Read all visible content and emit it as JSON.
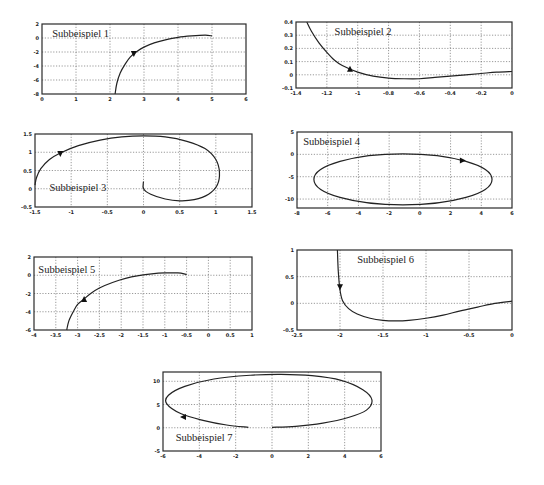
{
  "chart_data": [
    {
      "type": "line",
      "title": "Subbeispiel 1",
      "xlim": [
        0,
        6
      ],
      "ylim": [
        -8,
        2
      ],
      "xticks": [
        "0",
        "1",
        "2",
        "3",
        "4",
        "5",
        "6"
      ],
      "yticks": [
        "2",
        "0",
        "-2",
        "-4",
        "-6",
        "-8"
      ],
      "grid": true,
      "x": [
        2.15,
        2.2,
        2.3,
        2.45,
        2.6,
        2.8,
        3.0,
        3.3,
        3.6,
        4.0,
        4.4,
        4.8,
        5.0
      ],
      "y": [
        -8,
        -6.5,
        -5.0,
        -3.7,
        -2.7,
        -1.9,
        -1.3,
        -0.7,
        -0.3,
        0.1,
        0.3,
        0.4,
        0.3
      ],
      "arrow": {
        "x": 2.7,
        "y": -2.3,
        "direction": "down"
      },
      "label_pos": {
        "x": 0.3,
        "y": 0.2
      }
    },
    {
      "type": "line",
      "title": "Subbeispiel 2",
      "xlim": [
        -1.4,
        0
      ],
      "ylim": [
        -0.1,
        0.4
      ],
      "xticks": [
        "-1.4",
        "-1.2",
        "-1",
        "-0.8",
        "-0.6",
        "-0.4",
        "-0.2",
        "0"
      ],
      "yticks": [
        "0.4",
        "0.3",
        "0.2",
        "0.1",
        "0",
        "-0.1"
      ],
      "grid": true,
      "x": [
        -1.33,
        -1.3,
        -1.25,
        -1.2,
        -1.15,
        -1.1,
        -1.0,
        -0.9,
        -0.8,
        -0.7,
        -0.6,
        -0.5,
        -0.4,
        -0.3,
        -0.2,
        -0.1,
        0
      ],
      "y": [
        0.4,
        0.33,
        0.24,
        0.17,
        0.11,
        0.07,
        0.02,
        -0.01,
        -0.025,
        -0.03,
        -0.03,
        -0.02,
        -0.01,
        0.0,
        0.01,
        0.02,
        0.025
      ],
      "arrow": {
        "x": -1.05,
        "y": 0.045,
        "direction": "up"
      },
      "label_pos": {
        "x": -1.15,
        "y": 0.3
      }
    },
    {
      "type": "line",
      "title": "Subbeispiel 3",
      "xlim": [
        -1.5,
        1.5
      ],
      "ylim": [
        -0.5,
        1.5
      ],
      "xticks": [
        "-1.5",
        "-1",
        "-0.5",
        "0",
        "0.5",
        "1",
        "1.5"
      ],
      "yticks": [
        "1.5",
        "1",
        "0.5",
        "0",
        "-0.5"
      ],
      "grid": true,
      "x": [
        0,
        0,
        0.1,
        0.3,
        0.5,
        0.7,
        0.9,
        1.02,
        1.05,
        1.0,
        0.85,
        0.6,
        0.3,
        0.0,
        -0.3,
        -0.6,
        -0.9,
        -1.15,
        -1.3,
        -1.42,
        -1.48,
        -1.5
      ],
      "y": [
        0.2,
        0.0,
        -0.15,
        -0.28,
        -0.33,
        -0.3,
        -0.15,
        0.1,
        0.45,
        0.8,
        1.1,
        1.3,
        1.42,
        1.45,
        1.42,
        1.33,
        1.18,
        0.98,
        0.8,
        0.55,
        0.3,
        0.1
      ],
      "arrow": {
        "x": -1.15,
        "y": 0.95,
        "direction": "down"
      },
      "label_pos": {
        "x": -1.3,
        "y": -0.05
      }
    },
    {
      "type": "line",
      "title": "Subbeispiel 4",
      "xlim": [
        -8,
        6
      ],
      "ylim": [
        -12,
        5
      ],
      "xticks": [
        "-8",
        "-6",
        "-4",
        "-2",
        "0",
        "2",
        "4",
        "6"
      ],
      "yticks": [
        "5",
        "0",
        "-5",
        "-10"
      ],
      "grid": true,
      "ellipse": {
        "cx": -1.1,
        "cy": -5.6,
        "rx": 5.8,
        "ry": 5.7
      },
      "arrow": {
        "x": 2.8,
        "y": -1.4,
        "direction": "right"
      },
      "label_pos": {
        "x": -7.6,
        "y": 2
      }
    },
    {
      "type": "line",
      "title": "Subbeispiel 5",
      "xlim": [
        -4,
        1
      ],
      "ylim": [
        -6,
        2
      ],
      "xticks": [
        "-4",
        "-3.5",
        "-3",
        "-2.5",
        "-2",
        "-1.5",
        "-1",
        "-0.5",
        "0",
        "0.5",
        "1"
      ],
      "yticks": [
        "2",
        "0",
        "-2",
        "-4",
        "-6"
      ],
      "grid": true,
      "x": [
        -3.25,
        -3.2,
        -3.1,
        -3.0,
        -2.85,
        -2.7,
        -2.5,
        -2.2,
        -1.9,
        -1.6,
        -1.3,
        -1.0,
        -0.7,
        -0.5
      ],
      "y": [
        -6,
        -5.0,
        -4.0,
        -3.2,
        -2.6,
        -2.0,
        -1.4,
        -0.8,
        -0.35,
        -0.05,
        0.15,
        0.25,
        0.25,
        0.1
      ],
      "arrow": {
        "x": -2.85,
        "y": -2.6,
        "direction": "up"
      },
      "label_pos": {
        "x": -3.9,
        "y": 0.3
      }
    },
    {
      "type": "line",
      "title": "Subbeispiel 6",
      "xlim": [
        -2.5,
        0
      ],
      "ylim": [
        -0.5,
        1
      ],
      "xticks": [
        "-2.5",
        "-2",
        "-1.5",
        "-1",
        "-0.5",
        "0"
      ],
      "yticks": [
        "1",
        "0.5",
        "0",
        "-0.5"
      ],
      "grid": true,
      "x": [
        -2.03,
        -2.02,
        -2.0,
        -1.97,
        -1.9,
        -1.8,
        -1.65,
        -1.5,
        -1.35,
        -1.2,
        -1.0,
        -0.8,
        -0.6,
        -0.4,
        -0.2,
        0
      ],
      "y": [
        1.0,
        0.6,
        0.25,
        0.05,
        -0.1,
        -0.2,
        -0.28,
        -0.32,
        -0.33,
        -0.32,
        -0.28,
        -0.22,
        -0.14,
        -0.07,
        0.0,
        0.04
      ],
      "arrow": {
        "x": -2.0,
        "y": 0.3,
        "direction": "down"
      },
      "label_pos": {
        "x": -1.8,
        "y": 0.75
      }
    },
    {
      "type": "line",
      "title": "Subbeispiel 7",
      "xlim": [
        -6,
        6
      ],
      "ylim": [
        -5,
        12
      ],
      "xticks": [
        "-6",
        "-4",
        "-2",
        "0",
        "2",
        "4",
        "6"
      ],
      "yticks": [
        "10",
        "5",
        "0",
        "-5"
      ],
      "grid": true,
      "x": [
        -1.3,
        -2.5,
        -3.8,
        -5.0,
        -5.8,
        -5.7,
        -4.8,
        -3.2,
        -1.2,
        0.5,
        2.2,
        3.8,
        5.0,
        5.5,
        5.2,
        4.2,
        2.8,
        1.3,
        0
      ],
      "y": [
        0.1,
        0.6,
        1.6,
        3.0,
        5.2,
        7.0,
        8.9,
        10.5,
        11.3,
        11.5,
        11.2,
        10.2,
        8.2,
        6.0,
        3.8,
        2.2,
        1.0,
        0.3,
        0.1
      ],
      "arrow": {
        "x": -4.9,
        "y": 2.3,
        "direction": "left"
      },
      "label_pos": {
        "x": -5.3,
        "y": -2.8
      }
    }
  ],
  "layout": [
    {
      "left": 42,
      "top": 24,
      "width": 204,
      "height": 70
    },
    {
      "left": 296,
      "top": 22,
      "width": 216,
      "height": 66
    },
    {
      "left": 35,
      "top": 134,
      "width": 217,
      "height": 73
    },
    {
      "left": 297,
      "top": 132,
      "width": 215,
      "height": 76
    },
    {
      "left": 34,
      "top": 257,
      "width": 218,
      "height": 73
    },
    {
      "left": 297,
      "top": 250,
      "width": 215,
      "height": 80
    },
    {
      "left": 163,
      "top": 372,
      "width": 218,
      "height": 79
    }
  ]
}
